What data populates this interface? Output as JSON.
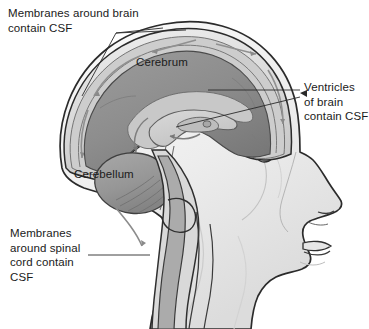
{
  "figure": {
    "background_color": "#ffffff",
    "width": 369,
    "height": 329
  },
  "labels": {
    "membranes_brain": "Membranes around brain\ncontain CSF",
    "cerebrum": "Cerebrum",
    "cerebellum": "Cerebellum",
    "ventricles": "Ventricles\nof brain\ncontain CSF",
    "membranes_spinal": "Membranes\naround spinal\ncord contain\nCSF"
  },
  "colors": {
    "outline": "#2b2b2b",
    "cerebrum_fill": "#8f8f8f",
    "cerebrum_shade": "#7d7d7d",
    "cerebellum_fill": "#9b9b9b",
    "ventricle_fill": "#cfcfcf",
    "skull_outer": "#e8e8e8",
    "meninges_band": "#b9b9b9",
    "csf_space": "#d8d8d8",
    "face_fill": "#f0f0f0",
    "face_shade": "#e0e0e0",
    "text": "#1a1a1a",
    "leader_line": "#2a2a2a",
    "arrow": "#8a8a8a"
  },
  "anatomy_parts": [
    "scalp",
    "skull bone",
    "dura mater",
    "subarachnoid space with CSF",
    "cerebrum",
    "cerebellum",
    "lateral ventricle",
    "third ventricle",
    "fourth ventricle",
    "brainstem",
    "spinal cord",
    "vertebral canal",
    "facial profile",
    "ear",
    "nose",
    "lips",
    "chin"
  ],
  "leader_lines": {
    "membranes_brain_targets": 2,
    "ventricles_targets": 2,
    "membranes_spinal_targets": 1
  }
}
